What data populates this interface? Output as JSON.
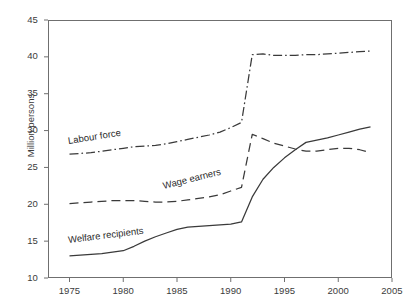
{
  "chart_data": {
    "type": "line",
    "title": "",
    "xlabel": "",
    "ylabel": "Million persons",
    "xlim": [
      1973,
      2005
    ],
    "ylim": [
      10,
      45
    ],
    "ytick_step": 5,
    "xtick_step": 5,
    "grid": false,
    "legend_position": "inline-labels",
    "xticks": [
      "1975",
      "1980",
      "1985",
      "1990",
      "1995",
      "2000",
      "2005"
    ],
    "yticks": [
      "10",
      "15",
      "20",
      "25",
      "30",
      "35",
      "40",
      "45"
    ],
    "series": [
      {
        "name": "Labour force",
        "style": "dash-dot",
        "color": "#3a3a3a",
        "x": [
          1975,
          1976,
          1977,
          1978,
          1979,
          1980,
          1981,
          1982,
          1983,
          1984,
          1985,
          1986,
          1987,
          1988,
          1989,
          1990,
          1991,
          1992,
          1993,
          1994,
          1995,
          1996,
          1997,
          1998,
          1999,
          2000,
          2001,
          2002,
          2003
        ],
        "values": [
          26.8,
          26.9,
          27.0,
          27.2,
          27.4,
          27.6,
          27.8,
          27.9,
          28.0,
          28.2,
          28.5,
          28.8,
          29.1,
          29.4,
          29.8,
          30.4,
          31.1,
          40.3,
          40.4,
          40.2,
          40.2,
          40.2,
          40.3,
          40.3,
          40.4,
          40.5,
          40.6,
          40.7,
          40.8
        ]
      },
      {
        "name": "Wage earners",
        "style": "dashed",
        "color": "#3a3a3a",
        "x": [
          1975,
          1976,
          1977,
          1978,
          1979,
          1980,
          1981,
          1982,
          1983,
          1984,
          1985,
          1986,
          1987,
          1988,
          1989,
          1990,
          1991,
          1992,
          1993,
          1994,
          1995,
          1996,
          1997,
          1998,
          1999,
          2000,
          2001,
          2002,
          2003
        ],
        "values": [
          20.1,
          20.2,
          20.3,
          20.4,
          20.5,
          20.5,
          20.5,
          20.4,
          20.3,
          20.3,
          20.4,
          20.6,
          20.8,
          21.0,
          21.3,
          21.8,
          22.3,
          29.5,
          28.9,
          28.3,
          27.9,
          27.5,
          27.2,
          27.2,
          27.4,
          27.6,
          27.6,
          27.4,
          27.0
        ]
      },
      {
        "name": "Welfare recipients",
        "style": "solid",
        "color": "#3a3a3a",
        "x": [
          1975,
          1976,
          1977,
          1978,
          1979,
          1980,
          1981,
          1982,
          1983,
          1984,
          1985,
          1986,
          1987,
          1988,
          1989,
          1990,
          1991,
          1992,
          1993,
          1994,
          1995,
          1996,
          1997,
          1998,
          1999,
          2000,
          2001,
          2002,
          2003
        ],
        "values": [
          13.0,
          13.1,
          13.2,
          13.3,
          13.5,
          13.7,
          14.3,
          15.0,
          15.6,
          16.1,
          16.6,
          16.9,
          17.0,
          17.1,
          17.2,
          17.3,
          17.6,
          21.0,
          23.4,
          25.0,
          26.3,
          27.4,
          28.4,
          28.7,
          29.0,
          29.4,
          29.8,
          30.2,
          30.5
        ]
      }
    ]
  },
  "annotations": {
    "labour_force": "Labour force",
    "wage_earners": "Wage earners",
    "welfare_recipients": "Welfare recipients"
  }
}
